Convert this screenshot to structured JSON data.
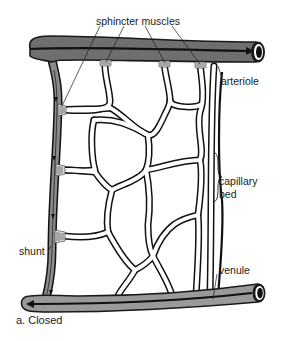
{
  "diagram": {
    "caption": "a. Closed",
    "labels": {
      "sphincter_muscles": "sphincter muscles",
      "arteriole": "arteriole",
      "capillary_bed_line1": "capillary",
      "capillary_bed_line2": "bed",
      "shunt": "shunt",
      "venule": "venule"
    },
    "colors": {
      "vessel_fill": "#6f6f6f",
      "vessel_outline": "#1a1a1a",
      "venule_fill": "#9a9a9a",
      "capillary_fill": "#ffffff",
      "capillary_outline": "#111111",
      "sphincter_fill": "#d8d8d8",
      "background": "#ffffff",
      "text": "#1a1a1a"
    },
    "flow": {
      "arteriole_direction": "left-to-right",
      "venule_direction": "right-to-left",
      "shunt_direction": "top-to-bottom"
    }
  }
}
